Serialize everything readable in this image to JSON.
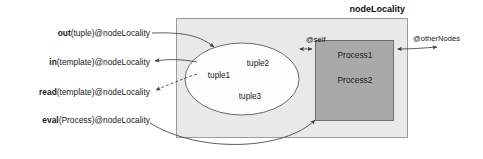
{
  "diagram": {
    "title": "nodeLocality",
    "container": {
      "label": "nodeLocality",
      "fill": "#e9e9e9",
      "stroke": "#9b9b9b"
    },
    "tuple_space": {
      "name": "tuple-space",
      "fill": "#fdfdfd",
      "tuples": [
        {
          "label": "tuple1"
        },
        {
          "label": "tuple2"
        },
        {
          "label": "tuple3"
        }
      ]
    },
    "process_group": {
      "name": "process-group",
      "fill": "#a9a9a9",
      "processes": [
        {
          "label": "Process1"
        },
        {
          "label": "Process2"
        }
      ]
    },
    "operations": [
      {
        "id": "out",
        "name": "out",
        "args": "(tuple)",
        "target": "@nodeLocality",
        "full": "out(tuple)@nodeLocality",
        "style": "solid",
        "direction": "into-tuple-space"
      },
      {
        "id": "in",
        "name": "in",
        "args": "(template)",
        "target": "@nodeLocality",
        "full": "in(template)@nodeLocality",
        "style": "solid",
        "direction": "out-of-tuple-space"
      },
      {
        "id": "read",
        "name": "read",
        "args": "(template)",
        "target": "@nodeLocality",
        "full": "read(template)@nodeLocality",
        "style": "dashed",
        "direction": "out-of-tuple-space"
      },
      {
        "id": "eval",
        "name": "eval",
        "args": "(Process)",
        "target": "@nodeLocality",
        "full": "eval(Process)@nodeLocality",
        "style": "solid",
        "direction": "into-process-group"
      }
    ],
    "channels": [
      {
        "id": "self",
        "label": "@self",
        "direction": "bidirectional",
        "from": "process-group",
        "to": "tuple-space"
      },
      {
        "id": "otherNodes",
        "label": "@otherNodes",
        "direction": "bidirectional",
        "from": "process-group",
        "to": "external"
      }
    ],
    "colors": {
      "background": "#ffffff",
      "container_fill": "#e9e9e9",
      "container_stroke": "#9b9b9b",
      "process_fill": "#a9a9a9",
      "process_stroke": "#6e6e6e",
      "ellipse_fill": "#fdfdfd",
      "ellipse_stroke": "#6b6b6b",
      "connector": "#4a4a4a",
      "text": "#1a1a1a"
    }
  }
}
